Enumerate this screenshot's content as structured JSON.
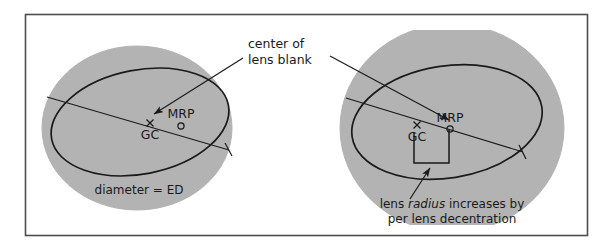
{
  "figure": {
    "frame": {
      "x": 25,
      "y": 14,
      "width": 563,
      "height": 222,
      "stroke": "#4d4d4d",
      "fill": "#ffffff"
    },
    "colors": {
      "blank_fill": "#b3b3b3",
      "blank_stroke": "#b3b3b3",
      "line": "#1a1a1a",
      "text": "#1a1a1a",
      "frame": "#4d4d4d",
      "page": "#ffffff"
    },
    "callout": {
      "line1": "center of",
      "line2": "lens blank"
    },
    "panels": [
      {
        "id": "left",
        "name": "standard-blank",
        "blank": {
          "cx": 137,
          "cy": 128,
          "rx": 95,
          "ry": 82,
          "clipped": false
        },
        "lens": {
          "cx": 140,
          "cy": 122,
          "rx": 90,
          "ry": 52,
          "rotation": -11
        },
        "markers": {
          "gc": {
            "label": "GC",
            "x": 150,
            "y": 123,
            "glyph": "x-cross"
          },
          "mrp": {
            "label": "MRP",
            "x": 181,
            "y": 123,
            "glyph": "small-circle"
          }
        },
        "diameter_line": {
          "x1": 47,
          "y1": 97,
          "x2": 229,
          "y2": 150,
          "tick": true
        },
        "caption": "diameter = ED"
      },
      {
        "id": "right",
        "name": "decentred-blank",
        "blank": {
          "cx": 452,
          "cy": 128,
          "rx": 110,
          "ry": 100,
          "clip_top": 30,
          "clip_bottom": 225,
          "clipped": true
        },
        "lens": {
          "cx": 447,
          "cy": 122,
          "rx": 96,
          "ry": 56,
          "rotation": -9
        },
        "markers": {
          "gc": {
            "label": "GC",
            "x": 417,
            "y": 125,
            "glyph": "x-cross"
          },
          "mrp": {
            "label": "MRP",
            "x": 450,
            "y": 126,
            "glyph": "small-circle"
          }
        },
        "diameter_line": {
          "x1": 346,
          "y1": 98,
          "x2": 523,
          "y2": 152,
          "tick": true
        },
        "bracket": {
          "x1": 414,
          "y1": 133,
          "x2": 449,
          "y2": 163
        },
        "caption_line1_pre": "lens ",
        "caption_line1_em": "radius",
        "caption_line1_post": " increases by",
        "caption_line2": "per lens decentration"
      }
    ]
  }
}
